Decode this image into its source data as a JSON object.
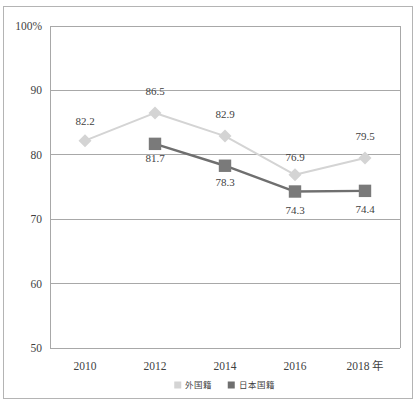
{
  "figure": {
    "top_cut_text": "",
    "bottom_cut_text": ""
  },
  "chart_data": {
    "type": "line",
    "title": "",
    "xlabel": "",
    "ylabel": "",
    "x_axis_unit_label": "年",
    "categories": [
      "2010",
      "2012",
      "2014",
      "2016",
      "2018"
    ],
    "ylim": [
      50,
      100
    ],
    "y_ticks": [
      50,
      60,
      70,
      80,
      90,
      100
    ],
    "y_tick_labels": [
      "50",
      "60",
      "70",
      "80",
      "90",
      "100%"
    ],
    "grid": true,
    "legend_position": "bottom-center",
    "series": [
      {
        "name": "外国籍",
        "marker": "diamond",
        "color": "#d4d4d4",
        "line_color": "#d4d4d4",
        "values": [
          82.2,
          86.5,
          82.9,
          76.9,
          79.5
        ],
        "labels": [
          "82.2",
          "86.5",
          "82.9",
          "76.9",
          "79.5"
        ]
      },
      {
        "name": "日本国籍",
        "marker": "square",
        "color": "#7a7a7a",
        "line_color": "#6f6f6f",
        "values": [
          null,
          81.7,
          78.3,
          74.3,
          74.4
        ],
        "labels": [
          "",
          "81.7",
          "78.3",
          "74.3",
          "74.4"
        ]
      }
    ]
  },
  "legend": {
    "items": [
      {
        "label": "外国籍",
        "color": "#d4d4d4",
        "marker": "square"
      },
      {
        "label": "日本国籍",
        "color": "#6f6f6f",
        "marker": "square"
      }
    ]
  }
}
